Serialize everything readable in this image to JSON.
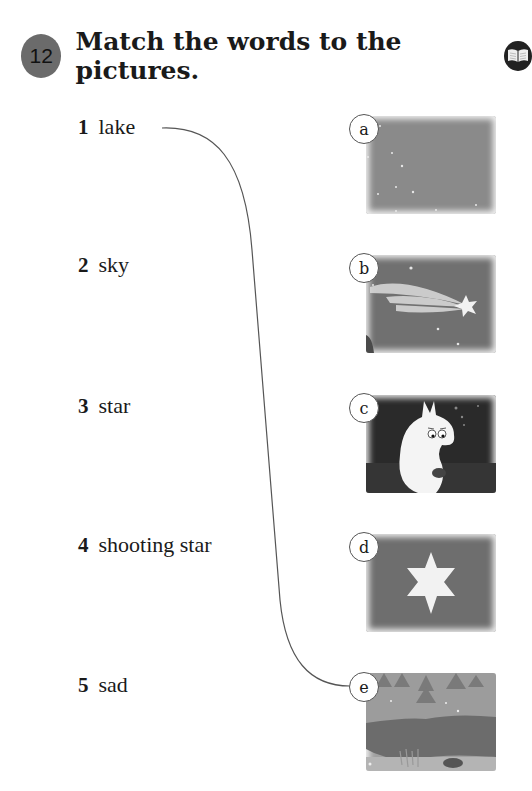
{
  "exercise": {
    "number": "12",
    "instruction": "Match the words to the pictures.",
    "icon": "book-icon"
  },
  "words": [
    {
      "number": "1",
      "text": "lake"
    },
    {
      "number": "2",
      "text": "sky"
    },
    {
      "number": "3",
      "text": "star"
    },
    {
      "number": "4",
      "text": "shooting star"
    },
    {
      "number": "5",
      "text": "sad"
    }
  ],
  "pictures": [
    {
      "label": "a",
      "description": "night sky with small stars"
    },
    {
      "label": "b",
      "description": "shooting star"
    },
    {
      "label": "c",
      "description": "sad Moomin sitting at night"
    },
    {
      "label": "d",
      "description": "six-pointed white star"
    },
    {
      "label": "e",
      "description": "lake with trees in winter"
    }
  ],
  "match_line": {
    "from_word": "1",
    "to_picture": "e",
    "color": "#555555"
  },
  "colors": {
    "badge": "#6b6b6b",
    "picture_gray": "#7d7d7d",
    "dark_picture": "#2a2a2a"
  }
}
